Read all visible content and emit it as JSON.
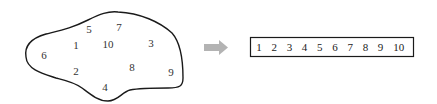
{
  "set": {
    "shape": "irregular-blob",
    "elements": [
      {
        "label": "5",
        "x": 89,
        "y": 33
      },
      {
        "label": "7",
        "x": 119,
        "y": 31
      },
      {
        "label": "1",
        "x": 76,
        "y": 49
      },
      {
        "label": "10",
        "x": 108,
        "y": 48
      },
      {
        "label": "3",
        "x": 151,
        "y": 47
      },
      {
        "label": "6",
        "x": 44,
        "y": 59
      },
      {
        "label": "8",
        "x": 132,
        "y": 71
      },
      {
        "label": "9",
        "x": 171,
        "y": 76
      },
      {
        "label": "2",
        "x": 76,
        "y": 75
      },
      {
        "label": "4",
        "x": 105,
        "y": 91
      }
    ]
  },
  "arrow": {
    "color": "#b3b3b3",
    "direction": "right"
  },
  "sequence": {
    "items": [
      "1",
      "2",
      "3",
      "4",
      "5",
      "6",
      "7",
      "8",
      "9",
      "10"
    ]
  },
  "colors": {
    "stroke": "#1a1a1a",
    "text": "#333333",
    "arrow": "#b3b3b3"
  }
}
